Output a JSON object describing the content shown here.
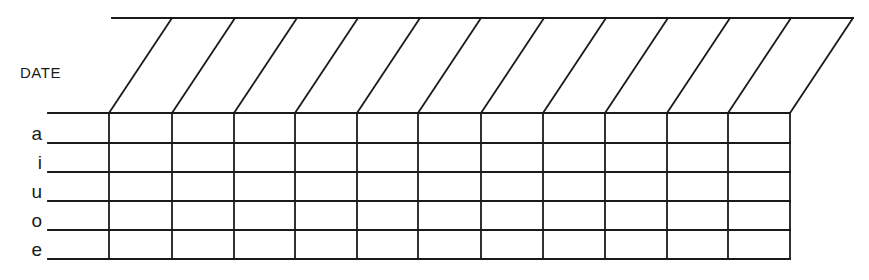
{
  "form": {
    "header_label": "DATE",
    "row_labels": [
      "a",
      "i",
      "u",
      "o",
      "e"
    ],
    "date_columns": 11,
    "date_entries": [
      "",
      "",
      "",
      "",
      "",
      "",
      "",
      "",
      "",
      "",
      ""
    ],
    "cells": [
      [
        "",
        "",
        "",
        "",
        "",
        "",
        "",
        "",
        "",
        "",
        ""
      ],
      [
        "",
        "",
        "",
        "",
        "",
        "",
        "",
        "",
        "",
        "",
        ""
      ],
      [
        "",
        "",
        "",
        "",
        "",
        "",
        "",
        "",
        "",
        "",
        ""
      ],
      [
        "",
        "",
        "",
        "",
        "",
        "",
        "",
        "",
        "",
        "",
        ""
      ],
      [
        "",
        "",
        "",
        "",
        "",
        "",
        "",
        "",
        "",
        "",
        ""
      ]
    ],
    "line_color": "#1a1a1a",
    "background_color": "#ffffff"
  }
}
